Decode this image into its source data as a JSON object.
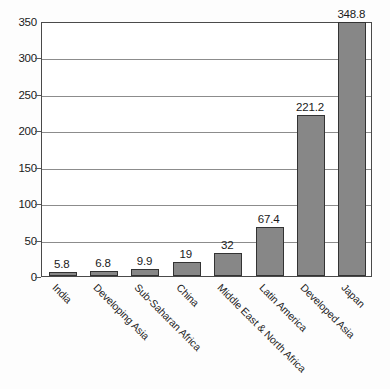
{
  "chart_data": {
    "type": "bar",
    "title": "",
    "subtitle": "",
    "xlabel": "",
    "ylabel": "",
    "categories": [
      "India",
      "Developing Asia",
      "Sub-Saharan Africa",
      "China",
      "Middle East & North Africa",
      "Latin America",
      "Developed Asia",
      "Japan"
    ],
    "values": [
      5.8,
      6.8,
      9.9,
      19,
      32,
      67.4,
      221.2,
      348.8
    ],
    "value_labels": [
      "5.8",
      "6.8",
      "9.9",
      "19",
      "32",
      "67.4",
      "221.2",
      "348.8"
    ],
    "ylim": [
      0,
      350
    ],
    "yticks": [
      0,
      50,
      100,
      150,
      200,
      250,
      300,
      350
    ],
    "ytick_labels": [
      "0",
      "50",
      "100",
      "150",
      "200",
      "250",
      "300",
      "350"
    ],
    "grid": "horizontal",
    "legend": "none",
    "bar_color": "#878787",
    "bar_border_color": "#333333",
    "grid_color": "#8c8c8c",
    "axis_color": "#4a4a4a",
    "background_color": "#fdfdfd",
    "plot_background_color": "#ffffff",
    "xtick_label_rotation": 45
  }
}
